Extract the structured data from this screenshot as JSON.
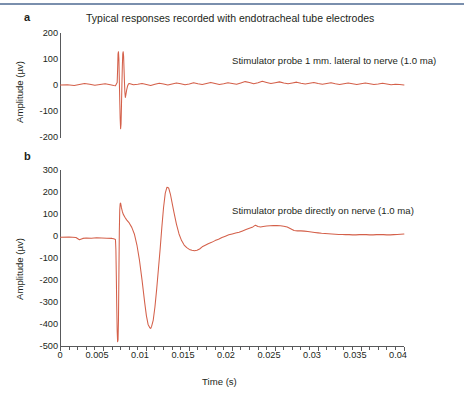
{
  "figure": {
    "title": "Typical responses recorded with endotracheal tube electrodes",
    "accent_line_color": "#7a8fad",
    "trace_color": "#d4604a",
    "axis_color": "#58595b",
    "text_color": "#231f20",
    "background": "#ffffff"
  },
  "panels": [
    {
      "label": "a",
      "annotation": "Stimulator probe 1 mm. lateral to nerve (1.0 ma)",
      "ylabel": "Amplitude (µv)",
      "xlabel": "",
      "yticks": [
        "200",
        "100",
        "0",
        "-100",
        "-200"
      ],
      "xticks": []
    },
    {
      "label": "b",
      "annotation": "Stimulator probe directly on nerve (1.0 ma)",
      "ylabel": "Amplitude (µv)",
      "xlabel": "Time (s)",
      "yticks": [
        "300",
        "200",
        "100",
        "0",
        "-100",
        "-200",
        "-300",
        "-400",
        "-500"
      ],
      "xticks": [
        "0",
        "0.005",
        "0.01",
        "0.015",
        "0.02",
        "0.025",
        "0.03",
        "0.035",
        "0.04"
      ]
    }
  ],
  "chart_data": [
    {
      "type": "line",
      "title": "Typical responses recorded with endotracheal tube electrodes",
      "panel": "a",
      "annotation": "Stimulator probe 1 mm. lateral to nerve (1.0 ma)",
      "xlabel": "",
      "ylabel": "Amplitude (µv)",
      "xlim": [
        0,
        0.04
      ],
      "ylim": [
        -200,
        200
      ],
      "yticks": [
        200,
        100,
        0,
        -100,
        -200
      ],
      "xticks": [
        0,
        0.005,
        0.01,
        0.015,
        0.02,
        0.025,
        0.03,
        0.035,
        0.04
      ],
      "grid": false,
      "legend": "none",
      "series": [
        {
          "name": "EMG response 1 mm lateral",
          "x": [
            0,
            0.0008,
            0.0016,
            0.0022,
            0.0028,
            0.0034,
            0.004,
            0.0046,
            0.0052,
            0.0058,
            0.0062,
            0.0064,
            0.0066,
            0.00665,
            0.0067,
            0.00675,
            0.0068,
            0.00685,
            0.0069,
            0.00695,
            0.007,
            0.00705,
            0.0071,
            0.00715,
            0.0072,
            0.00725,
            0.0073,
            0.00735,
            0.0074,
            0.00745,
            0.0075,
            0.00755,
            0.0076,
            0.0077,
            0.0078,
            0.0079,
            0.008,
            0.0082,
            0.0085,
            0.009,
            0.0095,
            0.01,
            0.0105,
            0.011,
            0.0115,
            0.012,
            0.0125,
            0.013,
            0.0135,
            0.014,
            0.0145,
            0.015,
            0.0155,
            0.016,
            0.0165,
            0.017,
            0.0175,
            0.018,
            0.0185,
            0.019,
            0.0195,
            0.02,
            0.0205,
            0.021,
            0.0215,
            0.022,
            0.0225,
            0.023,
            0.0235,
            0.024,
            0.0245,
            0.025,
            0.0255,
            0.026,
            0.0265,
            0.027,
            0.0275,
            0.028,
            0.0285,
            0.029,
            0.0295,
            0.03,
            0.0305,
            0.031,
            0.0315,
            0.032,
            0.0325,
            0.033,
            0.0335,
            0.034,
            0.0345,
            0.035,
            0.0355,
            0.036,
            0.0365,
            0.037,
            0.0375,
            0.038,
            0.0385,
            0.039,
            0.0395,
            0.04
          ],
          "y": [
            0,
            1,
            -2,
            2,
            6,
            3,
            -1,
            2,
            5,
            1,
            -2,
            -3,
            10,
            60,
            120,
            128,
            100,
            20,
            -60,
            -130,
            -168,
            -150,
            -80,
            0,
            70,
            120,
            128,
            110,
            60,
            10,
            -30,
            -48,
            -40,
            -20,
            -5,
            3,
            6,
            4,
            1,
            3,
            6,
            2,
            -2,
            3,
            7,
            4,
            0,
            4,
            8,
            5,
            1,
            4,
            9,
            5,
            2,
            6,
            10,
            6,
            2,
            5,
            9,
            6,
            3,
            8,
            13,
            10,
            5,
            9,
            14,
            10,
            6,
            9,
            12,
            8,
            5,
            8,
            11,
            7,
            4,
            7,
            10,
            6,
            3,
            6,
            9,
            5,
            2,
            5,
            8,
            5,
            2,
            5,
            8,
            5,
            2,
            4,
            7,
            4,
            1,
            3,
            2,
            0
          ]
        }
      ]
    },
    {
      "type": "line",
      "panel": "b",
      "annotation": "Stimulator probe directly on nerve (1.0 ma)",
      "xlabel": "Time (s)",
      "ylabel": "Amplitude (µv)",
      "xlim": [
        0,
        0.04
      ],
      "ylim": [
        -500,
        300
      ],
      "yticks": [
        300,
        200,
        100,
        0,
        -100,
        -200,
        -300,
        -400,
        -500
      ],
      "xticks": [
        0,
        0.005,
        0.01,
        0.015,
        0.02,
        0.025,
        0.03,
        0.035,
        0.04
      ],
      "grid": false,
      "legend": "none",
      "series": [
        {
          "name": "EMG response directly on nerve",
          "x": [
            0,
            0.001,
            0.0018,
            0.0022,
            0.0026,
            0.003,
            0.0036,
            0.0042,
            0.0048,
            0.0054,
            0.006,
            0.0062,
            0.0064,
            0.00645,
            0.0065,
            0.00655,
            0.0066,
            0.00665,
            0.0067,
            0.00675,
            0.0068,
            0.00685,
            0.0069,
            0.00695,
            0.007,
            0.00705,
            0.0071,
            0.0072,
            0.0073,
            0.0075,
            0.0077,
            0.008,
            0.0083,
            0.0086,
            0.0089,
            0.0092,
            0.0095,
            0.0098,
            0.01,
            0.0102,
            0.0104,
            0.0105,
            0.0106,
            0.0108,
            0.011,
            0.0112,
            0.0114,
            0.0116,
            0.0118,
            0.012,
            0.0122,
            0.0124,
            0.0126,
            0.0128,
            0.013,
            0.0132,
            0.0135,
            0.0138,
            0.0141,
            0.0144,
            0.0147,
            0.015,
            0.0153,
            0.0156,
            0.0159,
            0.0162,
            0.0165,
            0.0168,
            0.0172,
            0.0176,
            0.018,
            0.0184,
            0.0188,
            0.0192,
            0.0196,
            0.02,
            0.0204,
            0.0208,
            0.0212,
            0.0216,
            0.022,
            0.0224,
            0.0227,
            0.023,
            0.0233,
            0.0236,
            0.024,
            0.0244,
            0.0248,
            0.0252,
            0.0256,
            0.026,
            0.0264,
            0.0268,
            0.0272,
            0.0276,
            0.028,
            0.0284,
            0.0288,
            0.0292,
            0.0296,
            0.03,
            0.0304,
            0.0308,
            0.0312,
            0.0316,
            0.032,
            0.0324,
            0.0328,
            0.0332,
            0.0336,
            0.034,
            0.0344,
            0.0348,
            0.0352,
            0.0356,
            0.036,
            0.0364,
            0.0368,
            0.0372,
            0.0376,
            0.038,
            0.0384,
            0.0388,
            0.0392,
            0.0396,
            0.04
          ],
          "y": [
            -5,
            -4,
            -6,
            -16,
            -10,
            -8,
            -9,
            -7,
            -8,
            -9,
            -10,
            -12,
            -15,
            -60,
            -180,
            -320,
            -430,
            -478,
            -470,
            -380,
            -180,
            20,
            120,
            148,
            150,
            140,
            128,
            112,
            100,
            86,
            74,
            60,
            40,
            10,
            -40,
            -110,
            -200,
            -300,
            -360,
            -400,
            -415,
            -418,
            -410,
            -380,
            -320,
            -240,
            -150,
            -60,
            40,
            130,
            195,
            222,
            218,
            190,
            150,
            110,
            55,
            10,
            -20,
            -40,
            -52,
            -60,
            -64,
            -66,
            -64,
            -58,
            -48,
            -42,
            -34,
            -28,
            -20,
            -14,
            -6,
            0,
            6,
            10,
            14,
            18,
            24,
            30,
            36,
            42,
            50,
            44,
            42,
            44,
            46,
            47,
            48,
            48,
            47,
            45,
            42,
            34,
            26,
            24,
            24,
            23,
            21,
            19,
            17,
            15,
            13,
            12,
            11,
            10,
            9,
            8,
            8,
            7,
            7,
            6,
            6,
            7,
            8,
            7,
            6,
            6,
            7,
            8,
            7,
            6,
            6,
            7,
            8,
            9,
            10
          ]
        }
      ]
    }
  ]
}
